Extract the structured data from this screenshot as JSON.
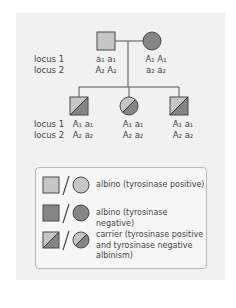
{
  "pedigree": {
    "locus_labels": [
      "locus 1",
      "locus 2"
    ],
    "parents": [
      {
        "sex": "male",
        "phenotype": "albino-tyrosinase-positive",
        "locus1": "a₁ a₁",
        "locus2": "A₂ A₂"
      },
      {
        "sex": "female",
        "phenotype": "albino-tyrosinase-negative",
        "locus1": "A₁ A₁",
        "locus2": "a₂ a₂"
      }
    ],
    "children_locus_labels": [
      "locus 1",
      "locus 2"
    ],
    "children": [
      {
        "sex": "male",
        "phenotype": "carrier",
        "locus1": "A₁ a₁",
        "locus2": "A₂ a₂"
      },
      {
        "sex": "female",
        "phenotype": "carrier",
        "locus1": "A₁ a₁",
        "locus2": "A₂ a₂"
      },
      {
        "sex": "male",
        "phenotype": "carrier",
        "locus1": "A₁ a₁",
        "locus2": "A₂ a₂"
      }
    ]
  },
  "legend": {
    "items": [
      {
        "symbol": "light-square-circle",
        "label": "albino (tyrosinase positive)"
      },
      {
        "symbol": "dark-square-circle",
        "label": "albino (tyrosinase negative)"
      },
      {
        "symbol": "half-square-circle",
        "label_lines": [
          "carrier (tyrosinase positive",
          "and tyrosinase negative",
          "albinism)"
        ]
      }
    ]
  },
  "colors": {
    "light_fill": "#c6c6c6",
    "dark_fill": "#858585",
    "stroke": "#4a4a4a",
    "panel_bg": "#f1f1f1"
  }
}
